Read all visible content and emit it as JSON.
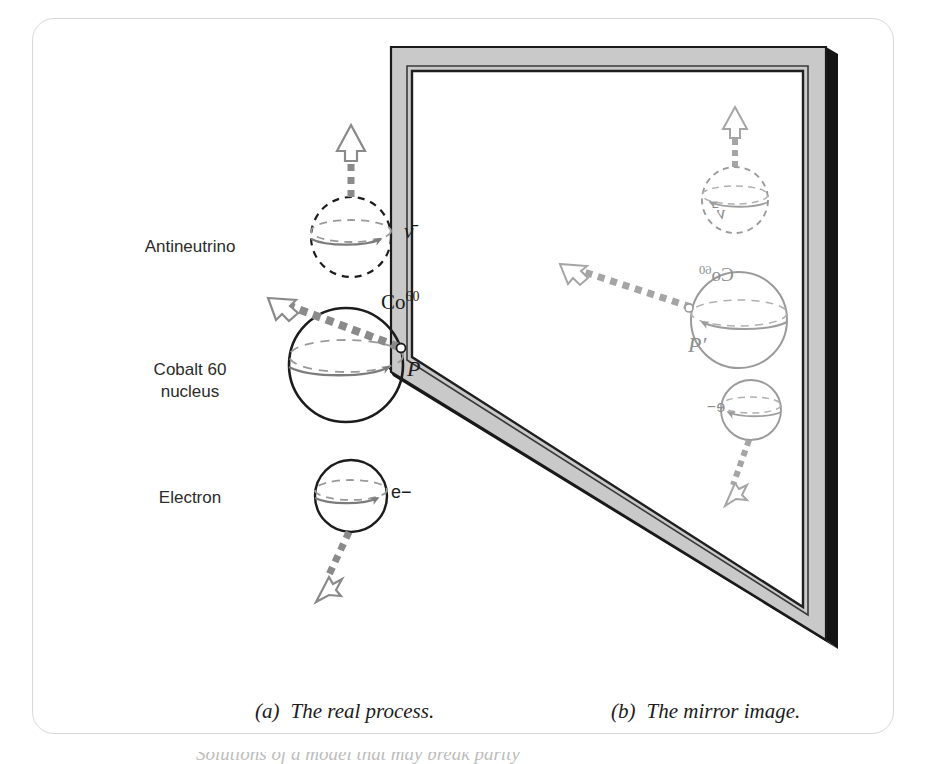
{
  "figure": {
    "side_labels": [
      {
        "id": "antineutrino",
        "text": "Antineutrino"
      },
      {
        "id": "cobalt",
        "text": "Cobalt 60\nnucleus"
      },
      {
        "id": "electron",
        "text": "Electron"
      }
    ],
    "captions": [
      {
        "tag": "(a)",
        "text": "The real process."
      },
      {
        "tag": "(b)",
        "text": "The mirror image."
      }
    ],
    "real_process": {
      "antineutrino_symbol": "ν̄",
      "nucleus_symbol_element": "Co",
      "nucleus_symbol_mass": "60",
      "point_label": "P",
      "electron_symbol": "e−"
    },
    "mirror_image": {
      "antineutrino_symbol": "ν̄",
      "nucleus_symbol_element": "Co",
      "nucleus_symbol_mass": "60",
      "point_label": "P′",
      "electron_symbol": "e−"
    },
    "colors": {
      "ink": "#1c1c1c",
      "spin_arrow": "#7a7a7a",
      "momentum_arrow": "#8a8a8a",
      "mirror_tone": "#9a9a9a",
      "frame_face": "#c9c9c9",
      "frame_edge_dark": "#1a1a1a",
      "card_border": "#d8d8d8"
    },
    "bottom_clipped_text": "Solutions of a model that may break parity"
  }
}
